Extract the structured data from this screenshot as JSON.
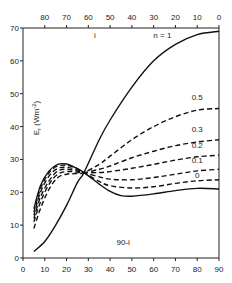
{
  "chart_data": {
    "type": "line",
    "title": "",
    "xlabel": "90-i",
    "xlabel_top": "i",
    "ylabel": "E_r (Wm^-2)",
    "xlim": [
      0,
      90
    ],
    "ylim": [
      0,
      70
    ],
    "x_ticks": [
      0,
      10,
      20,
      30,
      40,
      50,
      60,
      70,
      80,
      90
    ],
    "x_top_ticks": [
      80,
      70,
      60,
      50,
      40,
      30,
      20,
      10,
      0
    ],
    "y_ticks": [
      0,
      10,
      20,
      30,
      40,
      50,
      60,
      70
    ],
    "grid": false,
    "legend": "inline labels at right end of curves",
    "series": [
      {
        "name": "n = 1",
        "style": "solid",
        "x": [
          5,
          10,
          15,
          20,
          25,
          28,
          35,
          40,
          50,
          60,
          70,
          80,
          90
        ],
        "y": [
          2,
          5,
          10,
          16,
          23,
          26,
          36,
          42,
          52,
          60,
          65,
          68,
          69
        ]
      },
      {
        "name": "0.5",
        "style": "dashed",
        "x": [
          5,
          8,
          12,
          16,
          20,
          24,
          28,
          35,
          40,
          50,
          60,
          70,
          80,
          90
        ],
        "y": [
          9,
          15,
          21,
          24.5,
          25.5,
          25.7,
          26,
          28.5,
          31,
          36,
          40,
          43,
          45,
          45.5
        ]
      },
      {
        "name": "0.3",
        "style": "dashed",
        "x": [
          5,
          8,
          12,
          16,
          20,
          24,
          28,
          35,
          40,
          50,
          60,
          70,
          80,
          90
        ],
        "y": [
          11,
          17,
          22.5,
          25.5,
          26.3,
          26.2,
          26,
          27,
          28,
          30.5,
          32.5,
          34.2,
          35.3,
          36
        ]
      },
      {
        "name": "0.2",
        "style": "dashed",
        "x": [
          5,
          8,
          12,
          16,
          20,
          24,
          28,
          35,
          40,
          50,
          60,
          70,
          80,
          90
        ],
        "y": [
          12,
          18.5,
          23.5,
          26.5,
          27,
          26.6,
          26,
          26,
          26.3,
          27.3,
          28.5,
          29.8,
          30.8,
          31.3
        ]
      },
      {
        "name": "0.1",
        "style": "dashed",
        "x": [
          5,
          8,
          12,
          16,
          20,
          24,
          28,
          35,
          40,
          50,
          60,
          70,
          80,
          90
        ],
        "y": [
          13,
          20,
          25,
          27.3,
          27.6,
          27,
          26,
          24.7,
          24,
          23.8,
          24.5,
          25.5,
          26.5,
          27
        ]
      },
      {
        "name": "0",
        "style": "dashed",
        "x": [
          5,
          8,
          12,
          16,
          20,
          24,
          28,
          35,
          40,
          50,
          60,
          70,
          80,
          90
        ],
        "y": [
          14,
          21,
          26,
          28,
          28.2,
          27.5,
          26,
          23.3,
          22,
          21.3,
          21.7,
          22.7,
          23.5,
          23.8
        ]
      },
      {
        "name": "solid-lower",
        "style": "solid",
        "x": [
          5,
          8,
          12,
          16,
          20,
          24,
          28,
          35,
          40,
          45,
          50,
          60,
          70,
          80,
          90
        ],
        "y": [
          15,
          22,
          26.5,
          28.5,
          28.6,
          27.5,
          26,
          22.5,
          20.3,
          19,
          18.8,
          19.5,
          20.5,
          21.2,
          21
        ]
      }
    ],
    "annotations": [
      {
        "text": "i",
        "x": 33,
        "y": 67
      },
      {
        "text": "n = 1",
        "x": 64,
        "y": 67
      },
      {
        "text": "0.5",
        "x": 80,
        "y": 48
      },
      {
        "text": "0.3",
        "x": 80,
        "y": 38.5
      },
      {
        "text": "0.2",
        "x": 80,
        "y": 33.5
      },
      {
        "text": "0.1",
        "x": 80,
        "y": 29
      },
      {
        "text": "0",
        "x": 80,
        "y": 24.5
      },
      {
        "text": "90-i",
        "x": 46,
        "y": 4
      }
    ]
  },
  "labels": {
    "ylabel_main": "E",
    "ylabel_sub": "r",
    "ylabel_unit": "(Wm",
    "ylabel_exp": "-2",
    "ylabel_close": ")",
    "xlabel_bottom": "90-i",
    "xlabel_top": "i",
    "series_label_n1": "n = 1"
  }
}
